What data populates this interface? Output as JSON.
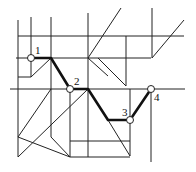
{
  "diagram": {
    "type": "piecewise-linear path on grid",
    "colors": {
      "lines": "#222222",
      "path": "#111111",
      "node_fill": "#ffffff"
    },
    "labels": [
      {
        "id": "1",
        "text": "1",
        "x": 35,
        "y": 54
      },
      {
        "id": "2",
        "text": "2",
        "x": 74,
        "y": 85
      },
      {
        "id": "3",
        "text": "3",
        "x": 122,
        "y": 116
      },
      {
        "id": "4",
        "text": "4",
        "x": 154,
        "y": 101
      }
    ],
    "nodes": [
      {
        "id": "1",
        "x": 31,
        "y": 58
      },
      {
        "id": "2",
        "x": 70,
        "y": 89
      },
      {
        "id": "3",
        "x": 130,
        "y": 120
      },
      {
        "id": "4",
        "x": 151,
        "y": 89
      }
    ],
    "path_points": "31,58 51,58 70,89 88,89 108,120 130,120 151,89"
  }
}
